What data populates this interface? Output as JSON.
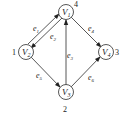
{
  "diagram": {
    "type": "directed-graph",
    "nodes": [
      {
        "id": "V1",
        "label": "V",
        "sub": "1",
        "number": "4",
        "x": 66,
        "y": 12
      },
      {
        "id": "V2",
        "label": "V",
        "sub": "2",
        "number": "1",
        "x": 26,
        "y": 52
      },
      {
        "id": "V3",
        "label": "V",
        "sub": "3",
        "number": "2",
        "x": 66,
        "y": 92
      },
      {
        "id": "V4",
        "label": "V",
        "sub": "4",
        "number": "3",
        "x": 106,
        "y": 52
      }
    ],
    "edges": [
      {
        "id": "e1",
        "label": "e",
        "sub": "1",
        "from": "V2",
        "to": "V1"
      },
      {
        "id": "e2",
        "label": "e",
        "sub": "2",
        "from": "V1",
        "to": "V2"
      },
      {
        "id": "e3",
        "label": "e",
        "sub": "3",
        "from": "V3",
        "to": "V1"
      },
      {
        "id": "e4",
        "label": "e",
        "sub": "4",
        "from": "V1",
        "to": "V4"
      },
      {
        "id": "e5",
        "label": "e",
        "sub": "5",
        "from": "V2",
        "to": "V3"
      },
      {
        "id": "e6",
        "label": "e",
        "sub": "6",
        "from": "V3",
        "to": "V4"
      }
    ],
    "colors": {
      "stroke": "#333333",
      "text": "#222222",
      "background": "#ffffff"
    }
  }
}
